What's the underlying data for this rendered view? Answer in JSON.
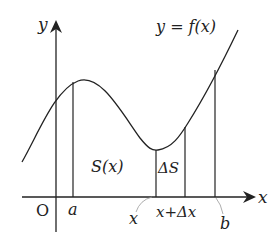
{
  "diagram": {
    "curve_label": "y = f(x)",
    "axes": {
      "x_label": "x",
      "y_label": "y",
      "origin_label": "O"
    },
    "points": {
      "a": "a",
      "x": "x",
      "x_plus_dx": "x+Δx",
      "b": "b"
    },
    "regions": {
      "area_label": "S(x)",
      "delta_area_label": "ΔS"
    },
    "colors": {
      "stroke": "#222222",
      "leader": "#999999",
      "background": "#ffffff"
    }
  }
}
